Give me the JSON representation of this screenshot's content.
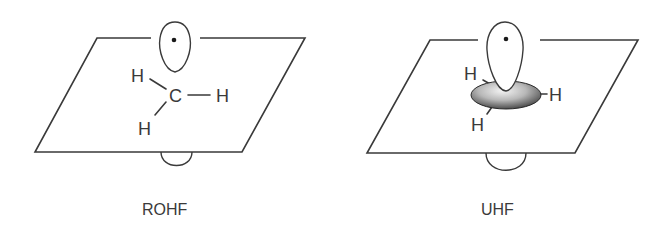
{
  "panels": [
    {
      "id": "rohf",
      "caption": "ROHF",
      "atoms": {
        "carbon": "C",
        "h_upper_left": "H",
        "h_right": "H",
        "h_lower_left": "H"
      },
      "orbital": "singly-occupied p orbital (lobe above plane with unpaired electron, small lobe below)"
    },
    {
      "id": "uhf",
      "caption": "UHF",
      "atoms": {
        "h_upper_left": "H",
        "h_right": "H",
        "h_lower_left": "H"
      },
      "orbital": "p orbital lobe above plane with unpaired electron, spin-polarized shaded ellipsoid in plane, small lobe below"
    }
  ],
  "colors": {
    "line": "#3a3a3a",
    "electron": "#1a1a1a",
    "ellipsoid_dark": "#2a2a2a",
    "ellipsoid_light": "#f2f2f2"
  }
}
